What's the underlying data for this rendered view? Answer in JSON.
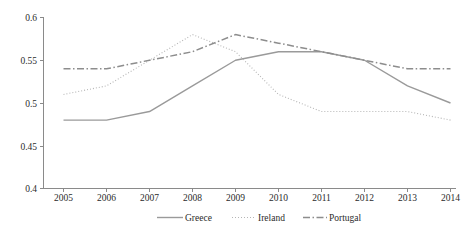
{
  "chart_data": {
    "type": "line",
    "title": "",
    "subtitle": "",
    "xlabel": "",
    "ylabel": "",
    "categories": [
      "2005",
      "2006",
      "2007",
      "2008",
      "2009",
      "2010",
      "2011",
      "2012",
      "2013",
      "2014"
    ],
    "x": [
      2005,
      2006,
      2007,
      2008,
      2009,
      2010,
      2011,
      2012,
      2013,
      2014
    ],
    "ylim": [
      0.4,
      0.6
    ],
    "xlim": [
      2005,
      2014
    ],
    "yticks": [
      0.4,
      0.45,
      0.5,
      0.55,
      0.6
    ],
    "ytick_labels": [
      "0.4",
      "0.45",
      "0.5",
      "0.55",
      "0.6"
    ],
    "xtick_labels": [
      "2005",
      "2006",
      "2007",
      "2008",
      "2009",
      "2010",
      "2011",
      "2012",
      "2013",
      "2014"
    ],
    "grid": false,
    "legend_position": "bottom",
    "series": [
      {
        "name": "Greece",
        "style": "solid",
        "color": "#9a9a9a",
        "values": [
          0.48,
          0.48,
          0.49,
          0.52,
          0.55,
          0.56,
          0.56,
          0.55,
          0.52,
          0.5
        ]
      },
      {
        "name": "Ireland",
        "style": "dotted",
        "color": "#b5b5b5",
        "values": [
          0.51,
          0.52,
          0.55,
          0.58,
          0.56,
          0.51,
          0.49,
          0.49,
          0.49,
          0.48
        ]
      },
      {
        "name": "Portugal",
        "style": "dashdot",
        "color": "#8d8d8d",
        "values": [
          0.54,
          0.54,
          0.55,
          0.56,
          0.58,
          0.57,
          0.56,
          0.55,
          0.54,
          0.54
        ]
      }
    ]
  },
  "legend": {
    "items": [
      {
        "label": "Greece"
      },
      {
        "label": "Ireland"
      },
      {
        "label": "Portugal"
      }
    ]
  },
  "axis": {
    "y_labels": [
      "0.6",
      "0.55",
      "0.5",
      "0.45",
      "0.4"
    ],
    "x_labels": [
      "2005",
      "2006",
      "2007",
      "2008",
      "2009",
      "2010",
      "2011",
      "2012",
      "2013",
      "2014"
    ]
  },
  "colors": {
    "axis": "#8a8a8a",
    "text": "#2b2b2b",
    "greece": "#9a9a9a",
    "ireland": "#b5b5b5",
    "portugal": "#8d8d8d",
    "background": "#ffffff"
  }
}
